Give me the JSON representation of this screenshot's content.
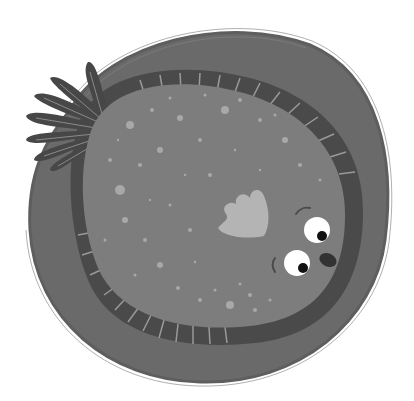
{
  "illustration": {
    "subject": "Cartoon flounder fish on a round stone-like background",
    "alt_text": "Flounder fish illustration",
    "colors": {
      "background": "#ffffff",
      "outer_disc": "#6a6a6a",
      "outer_disc_edge": "#5a5a5a",
      "fringe_band": "#4a4a4a",
      "fringe_lines": "#9a9a9a",
      "body": "#7d7d7d",
      "speckles": "#a8a8a8",
      "tail_fin": "#474747",
      "tail_rays": "#8a8a8a",
      "pectoral_fin": "#b4b4b4",
      "eye_white": "#ffffff",
      "pupil": "#111111",
      "mouth": "#333333"
    }
  }
}
